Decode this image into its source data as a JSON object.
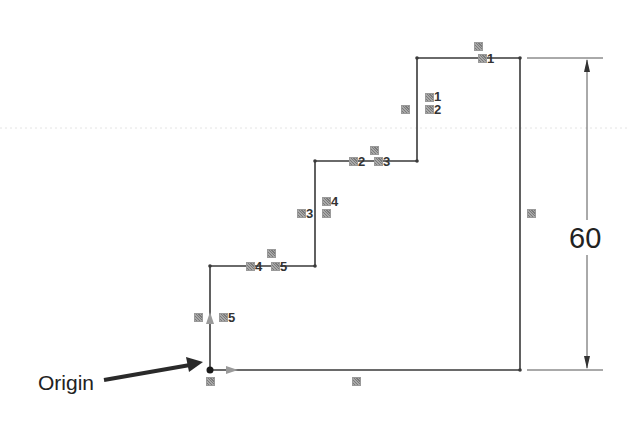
{
  "diagram": {
    "type": "cad-sketch-stepped-profile",
    "line_color": "#3a3a3a",
    "relation_icon_color": "#8f8f8f",
    "origin": {
      "label": "Origin",
      "point": [
        210,
        370
      ]
    },
    "dimension": {
      "value": "60",
      "orientation": "vertical",
      "from_y": 58,
      "to_y": 370,
      "x": 586
    },
    "relation_labels": [
      {
        "id": "top-1",
        "text": "1"
      },
      {
        "id": "v1-1",
        "text": "1"
      },
      {
        "id": "v1-2",
        "text": "2"
      },
      {
        "id": "h2-2",
        "text": "2"
      },
      {
        "id": "h2-3",
        "text": "3"
      },
      {
        "id": "v2-3",
        "text": "3"
      },
      {
        "id": "v2-4",
        "text": "4"
      },
      {
        "id": "h3-4",
        "text": "4"
      },
      {
        "id": "h3-5",
        "text": "5"
      },
      {
        "id": "v3-5",
        "text": "5"
      }
    ]
  }
}
